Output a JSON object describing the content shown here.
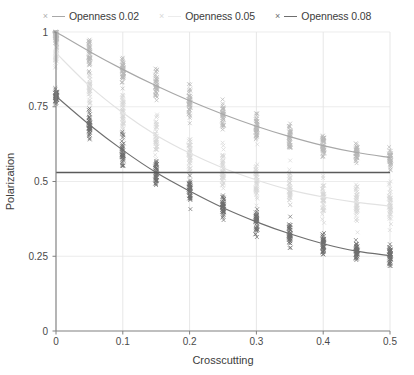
{
  "chart_data": {
    "type": "scatter",
    "title": "",
    "xlabel": "Crosscutting",
    "ylabel": "Polarization",
    "xlim": [
      0,
      0.5
    ],
    "ylim": [
      0,
      1
    ],
    "xticks": [
      "0",
      "0.1",
      "0.2",
      "0.3",
      "0.4",
      "0.5"
    ],
    "xtick_values": [
      0,
      0.1,
      0.2,
      0.3,
      0.4,
      0.5
    ],
    "yticks": [
      "0",
      "0.25",
      "0.5",
      "0.75",
      "1"
    ],
    "ytick_values": [
      0,
      0.25,
      0.5,
      0.75,
      1
    ],
    "grid": true,
    "legend_position": "top",
    "reference_line": {
      "y": 0.53,
      "color": "#5a5a5a",
      "orientation": "horizontal"
    },
    "x": [
      0,
      0.05,
      0.1,
      0.15,
      0.2,
      0.25,
      0.3,
      0.35,
      0.4,
      0.45,
      0.5
    ],
    "series": [
      {
        "name": "Openness 0.02",
        "marker": "x",
        "color": "#b8b8b8",
        "line_color": "#a8a8a8",
        "fit_values": [
          1.0,
          0.935,
          0.875,
          0.82,
          0.77,
          0.725,
          0.685,
          0.65,
          0.62,
          0.597,
          0.58
        ],
        "values": [
          0.985,
          0.93,
          0.872,
          0.818,
          0.768,
          0.723,
          0.683,
          0.65,
          0.62,
          0.597,
          0.58
        ],
        "spread": [
          0.03,
          0.055,
          0.06,
          0.06,
          0.06,
          0.055,
          0.05,
          0.045,
          0.045,
          0.04,
          0.04
        ]
      },
      {
        "name": "Openness 0.05",
        "marker": "x",
        "color": "#d6d6d6",
        "line_color": "#e2e2e2",
        "fit_values": [
          0.93,
          0.82,
          0.73,
          0.655,
          0.595,
          0.545,
          0.505,
          0.472,
          0.448,
          0.43,
          0.418
        ],
        "values": [
          0.93,
          0.82,
          0.73,
          0.655,
          0.595,
          0.545,
          0.505,
          0.472,
          0.448,
          0.43,
          0.418
        ],
        "spread": [
          0.06,
          0.09,
          0.095,
          0.095,
          0.09,
          0.088,
          0.085,
          0.082,
          0.08,
          0.078,
          0.075
        ]
      },
      {
        "name": "Openness 0.08",
        "marker": "x",
        "color": "#6e6e6e",
        "line_color": "#6e6e6e",
        "fit_values": [
          0.785,
          0.69,
          0.605,
          0.53,
          0.468,
          0.412,
          0.365,
          0.325,
          0.292,
          0.267,
          0.252
        ],
        "values": [
          0.785,
          0.69,
          0.605,
          0.53,
          0.468,
          0.412,
          0.365,
          0.325,
          0.292,
          0.267,
          0.252
        ],
        "spread": [
          0.028,
          0.048,
          0.055,
          0.058,
          0.058,
          0.055,
          0.052,
          0.048,
          0.044,
          0.04,
          0.036
        ]
      }
    ]
  },
  "legend": {
    "entries": [
      {
        "label": "Openness 0.02",
        "marker": "×",
        "swatch": "#b0b0b0"
      },
      {
        "label": "Openness 0.05",
        "marker": "×",
        "swatch": "#d8d8d8"
      },
      {
        "label": "Openness 0.08",
        "marker": "×",
        "swatch": "#6e6e6e"
      }
    ]
  },
  "axes": {
    "x_label": "Crosscutting",
    "y_label": "Polarization"
  }
}
